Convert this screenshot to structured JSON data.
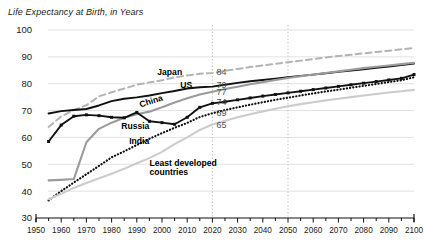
{
  "chart_data": {
    "type": "line",
    "title": "Life Expectancy at Birth, in Years",
    "xlabel": "",
    "ylabel": "",
    "xlim": [
      1950,
      2100
    ],
    "ylim": [
      30,
      100
    ],
    "ytick_step": 10,
    "xtick_step": 10,
    "xminor_step": 5,
    "grid": "horizontal",
    "legend": "inline-labels",
    "yticks": [
      "100",
      "90",
      "80",
      "70",
      "60",
      "50",
      "40",
      "30"
    ],
    "xticks": [
      "1950",
      "1960",
      "1970",
      "1980",
      "1990",
      "2000",
      "2010",
      "2020",
      "2030",
      "2040",
      "2050",
      "2060",
      "2070",
      "2080",
      "2090",
      "2100"
    ],
    "reference_lines": [
      2020,
      2050
    ],
    "annotations": [
      {
        "text": "Japan",
        "x": 2008,
        "y": 84.5
      },
      {
        "text": "US",
        "x": 2012,
        "y": 79.6
      },
      {
        "text": "China",
        "x": 1996,
        "y": 73.6
      },
      {
        "text": "Russia",
        "x": 1995,
        "y": 64.2
      },
      {
        "text": "India",
        "x": 1987,
        "y": 58.5
      },
      {
        "text": "Least developed",
        "x": 1995,
        "y": 50.5
      },
      {
        "text": "countries",
        "x": 1995,
        "y": 47.0
      }
    ],
    "value_labels": [
      {
        "series": "Japan",
        "value": "84",
        "at_x": 2020,
        "y": 84.5
      },
      {
        "series": "US",
        "value": "79",
        "at_x": 2020,
        "y": 79.6
      },
      {
        "series": "China",
        "value": "77",
        "at_x": 2020,
        "y": 76.8
      },
      {
        "series": "Russia",
        "value": "74",
        "at_x": 2020,
        "y": 73.2
      },
      {
        "series": "India",
        "value": "69",
        "at_x": 2020,
        "y": 69.2
      },
      {
        "series": "Least developed countries",
        "value": "65",
        "at_x": 2020,
        "y": 64.8
      }
    ],
    "x": [
      1955,
      1960,
      1965,
      1970,
      1975,
      1980,
      1985,
      1990,
      1995,
      2000,
      2005,
      2010,
      2015,
      2020,
      2025,
      2030,
      2035,
      2040,
      2045,
      2050,
      2055,
      2060,
      2065,
      2070,
      2075,
      2080,
      2085,
      2090,
      2095,
      2100
    ],
    "series": [
      {
        "name": "Japan",
        "style": "dashed",
        "color": "#b3b3b3",
        "values": [
          63.9,
          67.8,
          70.2,
          72.0,
          75.3,
          76.8,
          78.2,
          79.6,
          80.5,
          81.3,
          82.3,
          83.1,
          83.7,
          84.0,
          84.8,
          85.5,
          86.2,
          86.8,
          87.4,
          88.0,
          88.6,
          89.2,
          89.8,
          90.3,
          90.8,
          91.3,
          91.8,
          92.3,
          92.8,
          93.3
        ]
      },
      {
        "name": "US",
        "style": "solid",
        "color": "#111111",
        "values": [
          68.9,
          69.8,
          70.2,
          70.6,
          71.9,
          73.5,
          74.4,
          74.9,
          75.6,
          76.5,
          77.3,
          78.2,
          78.7,
          78.9,
          79.6,
          80.3,
          80.9,
          81.4,
          81.9,
          82.4,
          82.9,
          83.4,
          83.9,
          84.4,
          84.9,
          85.4,
          85.9,
          86.4,
          86.9,
          87.5
        ]
      },
      {
        "name": "China",
        "style": "solid",
        "color": "#9b9b9b",
        "values": [
          44.0,
          44.2,
          44.5,
          58.2,
          63.2,
          65.5,
          67.3,
          68.6,
          69.6,
          71.2,
          73.0,
          74.6,
          76.0,
          77.0,
          78.0,
          78.9,
          79.8,
          80.6,
          81.4,
          82.1,
          82.8,
          83.4,
          84.0,
          84.6,
          85.2,
          85.8,
          86.3,
          86.8,
          87.3,
          87.8
        ]
      },
      {
        "name": "Russia",
        "style": "solid-markers",
        "color": "#111111",
        "values": [
          58.5,
          64.6,
          67.9,
          68.4,
          68.1,
          67.5,
          67.3,
          69.3,
          66.0,
          65.5,
          64.9,
          67.5,
          71.2,
          72.7,
          73.3,
          74.0,
          74.7,
          75.4,
          76.0,
          76.6,
          77.2,
          77.8,
          78.4,
          79.0,
          79.6,
          80.2,
          80.8,
          81.4,
          82.0,
          83.4
        ]
      },
      {
        "name": "India",
        "style": "dotted",
        "color": "#111111",
        "values": [
          36.6,
          40.0,
          43.2,
          46.3,
          49.4,
          52.6,
          54.8,
          57.2,
          59.5,
          61.6,
          63.6,
          65.4,
          67.6,
          69.0,
          70.2,
          71.2,
          72.2,
          73.1,
          74.0,
          74.8,
          75.6,
          76.4,
          77.1,
          77.8,
          78.5,
          79.2,
          79.9,
          80.6,
          81.3,
          82.4
        ]
      },
      {
        "name": "Least developed countries",
        "style": "solid",
        "color": "#cccccc",
        "values": [
          37.0,
          39.0,
          41.2,
          43.0,
          44.8,
          46.5,
          48.3,
          50.4,
          52.3,
          54.6,
          57.5,
          60.0,
          62.8,
          64.8,
          66.2,
          67.5,
          68.6,
          69.7,
          70.7,
          71.6,
          72.4,
          73.1,
          73.8,
          74.4,
          75.0,
          75.6,
          76.2,
          76.7,
          77.2,
          77.7
        ]
      }
    ]
  }
}
